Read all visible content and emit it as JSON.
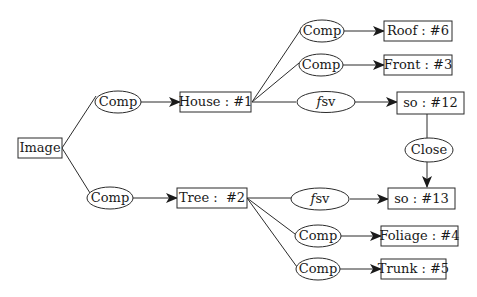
{
  "diagram": {
    "type": "tree-graph",
    "colors": {
      "stroke": "#2b2b2b",
      "text": "#1a1a1a",
      "background": "#ffffff"
    },
    "nodes": {
      "image": {
        "label": "Image",
        "shape": "rect"
      },
      "comp_house": {
        "label": "Comp",
        "shape": "ellipse"
      },
      "comp_tree": {
        "label": "Comp",
        "shape": "ellipse"
      },
      "house": {
        "label": "House : #1",
        "shape": "rect"
      },
      "tree": {
        "label": "Tree :  #2",
        "shape": "rect"
      },
      "comp_roof": {
        "label": "Comp",
        "shape": "ellipse"
      },
      "comp_front": {
        "label": "Comp",
        "shape": "ellipse"
      },
      "fsv_house": {
        "label_f": "f",
        "label_rest": "sv",
        "shape": "ellipse"
      },
      "roof": {
        "label": "Roof : #6",
        "shape": "rect"
      },
      "front": {
        "label": "Front : #3",
        "shape": "rect"
      },
      "so12": {
        "label": "so : #12",
        "shape": "rect"
      },
      "close": {
        "label": "Close",
        "shape": "ellipse"
      },
      "fsv_tree": {
        "label_f": "f",
        "label_rest": "sv",
        "shape": "ellipse"
      },
      "so13": {
        "label": "so : #13",
        "shape": "rect"
      },
      "comp_foliage": {
        "label": "Comp",
        "shape": "ellipse"
      },
      "comp_trunk": {
        "label": "Comp",
        "shape": "ellipse"
      },
      "foliage": {
        "label": "Foliage : #4",
        "shape": "rect"
      },
      "trunk": {
        "label": "Trunk : #5",
        "shape": "rect"
      }
    },
    "edges": [
      {
        "from": "image",
        "to": "comp_house",
        "arrow": false
      },
      {
        "from": "image",
        "to": "comp_tree",
        "arrow": false
      },
      {
        "from": "comp_house",
        "to": "house",
        "arrow": true
      },
      {
        "from": "comp_tree",
        "to": "tree",
        "arrow": true
      },
      {
        "from": "house",
        "to": "comp_roof",
        "arrow": false
      },
      {
        "from": "house",
        "to": "comp_front",
        "arrow": false
      },
      {
        "from": "house",
        "to": "fsv_house",
        "arrow": false
      },
      {
        "from": "comp_roof",
        "to": "roof",
        "arrow": true
      },
      {
        "from": "comp_front",
        "to": "front",
        "arrow": true
      },
      {
        "from": "fsv_house",
        "to": "so12",
        "arrow": true
      },
      {
        "from": "so12",
        "to": "close",
        "arrow": false
      },
      {
        "from": "close",
        "to": "so13",
        "arrow": true
      },
      {
        "from": "tree",
        "to": "fsv_tree",
        "arrow": false
      },
      {
        "from": "tree",
        "to": "comp_foliage",
        "arrow": false
      },
      {
        "from": "tree",
        "to": "comp_trunk",
        "arrow": false
      },
      {
        "from": "fsv_tree",
        "to": "so13",
        "arrow": true
      },
      {
        "from": "comp_foliage",
        "to": "foliage",
        "arrow": true
      },
      {
        "from": "comp_trunk",
        "to": "trunk",
        "arrow": true
      }
    ]
  }
}
